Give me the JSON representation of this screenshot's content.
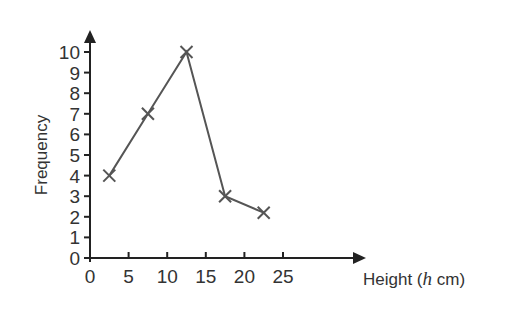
{
  "chart_data": {
    "type": "line",
    "title": "",
    "xlabel": "Height (h cm)",
    "xlabel_parts": {
      "prefix": "Height (",
      "italic": "h",
      "suffix": " cm)"
    },
    "ylabel": "Frequency",
    "x_ticks": [
      0,
      5,
      10,
      15,
      20,
      25
    ],
    "y_ticks": [
      0,
      1,
      2,
      3,
      4,
      5,
      6,
      7,
      8,
      9,
      10
    ],
    "xlim": [
      0,
      25
    ],
    "ylim": [
      0,
      10
    ],
    "grid": false,
    "legend": null,
    "marker": "x",
    "series": [
      {
        "name": "Frequency polygon",
        "x": [
          2.5,
          7.5,
          12.5,
          17.5,
          22.5
        ],
        "y": [
          4,
          7,
          10,
          3,
          2.2
        ]
      }
    ],
    "colors": {
      "axis": "#222222",
      "line": "#555555",
      "text": "#333333"
    }
  }
}
